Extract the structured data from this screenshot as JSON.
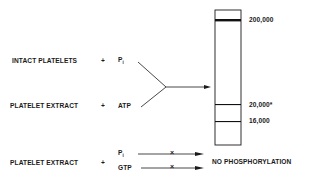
{
  "rows": [
    {
      "label": "INTACT PLATELETS",
      "plus": "+",
      "reagent": "P",
      "reagent_sub": "i"
    },
    {
      "label": "PLATELET EXTRACT",
      "plus": "+",
      "reagent": "ATP",
      "reagent_sub": ""
    },
    {
      "label": "PLATELET EXTRACT",
      "plus": "+",
      "reagents": [
        {
          "name": "P",
          "sub": "i"
        },
        {
          "name": "GTP",
          "sub": ""
        }
      ],
      "blocked_mark": "×",
      "result": "NO PHOSPHORYLATION"
    }
  ],
  "gel": {
    "bands": [
      {
        "label": "200,000",
        "thickness": "thick"
      },
      {
        "label": "20,000*",
        "thickness": "thin"
      },
      {
        "label": "16,000",
        "thickness": "thin"
      }
    ]
  },
  "colors": {
    "ink": "#1a1a1a",
    "background": "#ffffff"
  }
}
